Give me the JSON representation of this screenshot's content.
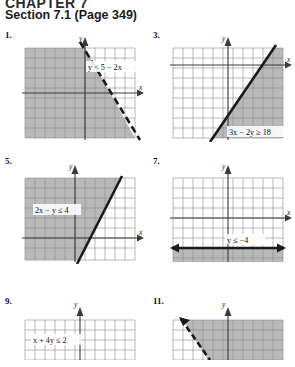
{
  "header": {
    "chapter_line": "CHAPTER 7",
    "section_line": "Section 7.1 (Page 349)"
  },
  "axis": {
    "x_label": "x",
    "y_label": "y"
  },
  "problems": [
    {
      "number": "1.",
      "equation": "y < 5 − 2x",
      "line_style": "dashed",
      "shaded_side": "left",
      "slope_desc": "negative-steep",
      "grid_cols": 11,
      "grid_rows": 10
    },
    {
      "number": "3.",
      "equation": "3x − 2y ≥ 18",
      "line_style": "solid",
      "shaded_side": "right-below",
      "slope_desc": "positive",
      "grid_cols": 11,
      "grid_rows": 10
    },
    {
      "number": "5.",
      "equation": "2x − y ≤ 4",
      "line_style": "solid",
      "shaded_side": "left-above",
      "slope_desc": "positive-steep",
      "grid_cols": 11,
      "grid_rows": 9
    },
    {
      "number": "7.",
      "equation": "y ≤ −4",
      "line_style": "solid-horizontal",
      "shaded_side": "below",
      "slope_desc": "horizontal",
      "grid_cols": 11,
      "grid_rows": 10
    },
    {
      "number": "9.",
      "equation": "x + 4y ≤ 2",
      "line_style": "solid",
      "shaded_side": "below",
      "slope_desc": "shallow-negative",
      "grid_cols": 11,
      "grid_rows": 4
    },
    {
      "number": "11.",
      "equation": "",
      "line_style": "dashed",
      "shaded_side": "right-above",
      "slope_desc": "negative-steep",
      "grid_cols": 11,
      "grid_rows": 4
    }
  ],
  "colors": {
    "shade": "#b9b9b9",
    "grid": "#8a8a8a",
    "axis": "#3a3a3a",
    "line": "#1a1a1a",
    "page_bg": "#ffffff"
  }
}
